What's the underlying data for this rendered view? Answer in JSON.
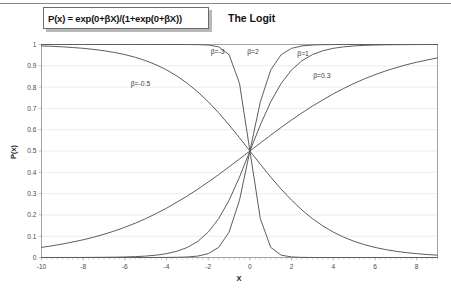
{
  "slide": {
    "formula": "P(x) = exp(0+βX)/(1+exp(0+βX))",
    "title": "The Logit"
  },
  "chart_data": {
    "type": "line",
    "title": "The Logit",
    "xlabel": "X",
    "ylabel": "P(x)",
    "xlim": [
      -10,
      9
    ],
    "ylim": [
      0,
      1
    ],
    "grid": true,
    "legend_position": "inline-annotations",
    "xticks": [
      -10,
      -8,
      -6,
      -4,
      -2,
      0,
      2,
      4,
      6,
      8
    ],
    "xtick_labels": [
      "-10",
      "-8",
      "-6",
      "-4",
      "-2",
      "0",
      "2",
      "4",
      "6",
      "8"
    ],
    "yticks": [
      0,
      0.1,
      0.2,
      0.3,
      0.4,
      0.5,
      0.6,
      0.7,
      0.8,
      0.9,
      1
    ],
    "ytick_labels": [
      "0",
      "0.1",
      "0.2",
      "0.3",
      "0.4",
      "0.5",
      "0.6",
      "0.7",
      "0.8",
      "0.9",
      "1"
    ],
    "function": "P(x) = exp(beta*X)/(1+exp(beta*X))",
    "x": [
      -10,
      -9.5,
      -9,
      -8.5,
      -8,
      -7.5,
      -7,
      -6.5,
      -6,
      -5.5,
      -5,
      -4.5,
      -4,
      -3.5,
      -3,
      -2.5,
      -2,
      -1.5,
      -1,
      -0.5,
      0,
      0.5,
      1,
      1.5,
      2,
      2.5,
      3,
      3.5,
      4,
      4.5,
      5,
      5.5,
      6,
      6.5,
      7,
      7.5,
      8,
      8.5,
      9
    ],
    "series": [
      {
        "name": "β=-3",
        "beta": -3,
        "label": "β=-3",
        "label_x": -1.55,
        "label_y": 0.955,
        "values": [
          1,
          1,
          1,
          1,
          1,
          1,
          1,
          1,
          1,
          1,
          1,
          1,
          1,
          1,
          0.9999,
          0.9994,
          0.9975,
          0.989,
          0.9526,
          0.8176,
          0.5,
          0.1824,
          0.0474,
          0.011,
          0.0025,
          0.0006,
          0.0001,
          0.0,
          0.0,
          0.0,
          0.0,
          0.0,
          0.0,
          0.0,
          0.0,
          0.0,
          0.0,
          0.0,
          0.0
        ]
      },
      {
        "name": "β=-0.5",
        "beta": -0.5,
        "label": "β=-0.5",
        "label_x": -5.25,
        "label_y": 0.803,
        "values": [
          0.9933,
          0.9915,
          0.989,
          0.9859,
          0.982,
          0.977,
          0.9707,
          0.9626,
          0.9526,
          0.9399,
          0.9241,
          0.9046,
          0.8808,
          0.8519,
          0.8176,
          0.7773,
          0.7311,
          0.6792,
          0.6225,
          0.5622,
          0.5,
          0.4378,
          0.3775,
          0.3208,
          0.2689,
          0.2227,
          0.1824,
          0.1481,
          0.1192,
          0.0954,
          0.0759,
          0.0601,
          0.0474,
          0.0373,
          0.0293,
          0.023,
          0.018,
          0.0141,
          0.011
        ]
      },
      {
        "name": "β=0.3",
        "beta": 0.3,
        "label": "β=0.3",
        "label_x": 3.45,
        "label_y": 0.843,
        "values": [
          0.0474,
          0.0548,
          0.0632,
          0.0728,
          0.0832,
          0.0953,
          0.1091,
          0.1244,
          0.1419,
          0.1611,
          0.1824,
          0.2063,
          0.2315,
          0.2601,
          0.2891,
          0.3208,
          0.3543,
          0.3892,
          0.4256,
          0.4626,
          0.5,
          0.5374,
          0.5744,
          0.6108,
          0.6457,
          0.6792,
          0.7109,
          0.7399,
          0.7685,
          0.7937,
          0.8176,
          0.8389,
          0.8581,
          0.8756,
          0.8909,
          0.9047,
          0.9168,
          0.9272,
          0.937
        ]
      },
      {
        "name": "β=1",
        "beta": 1,
        "label": "β=1",
        "label_x": 2.55,
        "label_y": 0.948,
        "values": [
          0.0,
          0.0001,
          0.0001,
          0.0002,
          0.0003,
          0.0006,
          0.0009,
          0.0015,
          0.0025,
          0.0041,
          0.0067,
          0.011,
          0.018,
          0.0293,
          0.0474,
          0.0759,
          0.1192,
          0.1824,
          0.2689,
          0.3775,
          0.5,
          0.6225,
          0.7311,
          0.8176,
          0.8808,
          0.9241,
          0.9526,
          0.9707,
          0.982,
          0.989,
          0.9933,
          0.9959,
          0.9975,
          0.9985,
          0.9991,
          0.9994,
          0.9997,
          0.9998,
          0.9999
        ]
      },
      {
        "name": "β=2",
        "beta": 2,
        "label": "β=2",
        "label_x": 0.15,
        "label_y": 0.957,
        "values": [
          0.0,
          0.0,
          0.0,
          0.0,
          0.0,
          0.0,
          0.0,
          0.0,
          0.0,
          0.0,
          0.0,
          0.0001,
          0.0003,
          0.0009,
          0.0025,
          0.0067,
          0.018,
          0.0474,
          0.1192,
          0.2689,
          0.5,
          0.7311,
          0.8808,
          0.9526,
          0.982,
          0.9933,
          0.9975,
          0.9991,
          0.9997,
          0.9999,
          1,
          1,
          1,
          1,
          1,
          1,
          1,
          1,
          1
        ]
      }
    ]
  }
}
